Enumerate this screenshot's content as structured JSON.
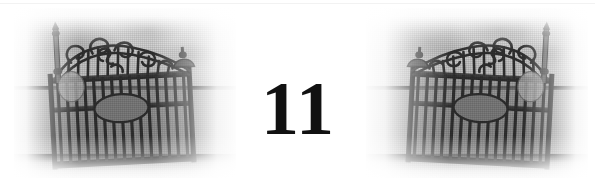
{
  "page": {
    "width": 595,
    "height": 184,
    "background_color": "#ffffff",
    "kind": "scanned-book-page-header"
  },
  "page_number": {
    "value": "11",
    "color": "#111111"
  },
  "decoration": {
    "top_rule_color": "#f2f2f2",
    "subject": "ornate wrought iron gate photograph",
    "plates": [
      {
        "name": "left-gate-photo",
        "alt": "Black and white photograph of an ornate wrought iron gate leaning against a wall",
        "mirrored": false
      },
      {
        "name": "right-gate-photo",
        "alt": "Mirrored black and white photograph of the same ornate wrought iron gate",
        "mirrored": true
      }
    ],
    "palette": {
      "sky_light": "#dedede",
      "sky_dark": "#b4b4b4",
      "horizon_line": "#2e2e2e",
      "ground": "#9b9b9b",
      "iron_dark": "#2b2b2b",
      "iron_mid": "#5d5d5d",
      "medallion": "#787878"
    }
  }
}
